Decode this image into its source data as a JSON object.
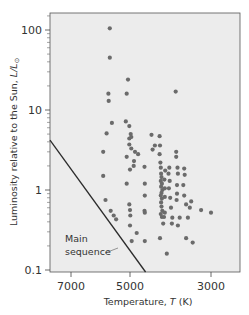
{
  "chart_data": {
    "type": "scatter",
    "title": "",
    "xlabel": "Temperature, T (K)",
    "ylabel": "Luminosity relative to the Sun, L/L⊙",
    "x_scale": "log",
    "x_reversed": true,
    "y_scale": "log",
    "xlim": [
      7800,
      2200
    ],
    "ylim": [
      0.1,
      160
    ],
    "x_ticks": [
      7000,
      5000,
      3000
    ],
    "x_tick_labels": [
      "7000",
      "5000",
      "3000"
    ],
    "y_ticks": [
      0.1,
      1,
      10,
      100
    ],
    "y_tick_labels": [
      "0.1",
      "1",
      "10",
      "100"
    ],
    "grid": false,
    "legend": null,
    "background": "#ececec",
    "point_color": "#6b6b6b",
    "line_color": "#2b2b2b",
    "annotations": [
      {
        "text_lines": [
          "Main",
          "sequence"
        ],
        "points_to": "main-sequence-line"
      }
    ],
    "lines": [
      {
        "name": "Main sequence",
        "points": [
          {
            "T": 7800,
            "L": 4.2
          },
          {
            "T": 4550,
            "L": 0.1
          }
        ]
      }
    ],
    "series": [
      {
        "name": "Stars",
        "points": [
          {
            "T": 5650,
            "L": 105
          },
          {
            "T": 5650,
            "L": 45
          },
          {
            "T": 5700,
            "L": 16
          },
          {
            "T": 5690,
            "L": 13
          },
          {
            "T": 5580,
            "L": 6.9
          },
          {
            "T": 5760,
            "L": 5.1
          },
          {
            "T": 5880,
            "L": 3.0
          },
          {
            "T": 5880,
            "L": 1.5
          },
          {
            "T": 5800,
            "L": 0.75
          },
          {
            "T": 5620,
            "L": 0.55
          },
          {
            "T": 5520,
            "L": 0.48
          },
          {
            "T": 5440,
            "L": 0.43
          },
          {
            "T": 5060,
            "L": 24
          },
          {
            "T": 5100,
            "L": 16
          },
          {
            "T": 5130,
            "L": 7.2
          },
          {
            "T": 5020,
            "L": 6.3
          },
          {
            "T": 4980,
            "L": 5.0
          },
          {
            "T": 5020,
            "L": 4.4
          },
          {
            "T": 4960,
            "L": 4.6
          },
          {
            "T": 5020,
            "L": 3.7
          },
          {
            "T": 4960,
            "L": 3.3
          },
          {
            "T": 4850,
            "L": 3.0
          },
          {
            "T": 4760,
            "L": 2.8
          },
          {
            "T": 5100,
            "L": 2.6
          },
          {
            "T": 4880,
            "L": 2.3
          },
          {
            "T": 4890,
            "L": 2.0
          },
          {
            "T": 5000,
            "L": 1.8
          },
          {
            "T": 5100,
            "L": 1.2
          },
          {
            "T": 5020,
            "L": 0.66
          },
          {
            "T": 5000,
            "L": 0.56
          },
          {
            "T": 4990,
            "L": 0.48
          },
          {
            "T": 5000,
            "L": 0.36
          },
          {
            "T": 4950,
            "L": 0.23
          },
          {
            "T": 4800,
            "L": 0.29
          },
          {
            "T": 4580,
            "L": 1.95
          },
          {
            "T": 4570,
            "L": 1.2
          },
          {
            "T": 4570,
            "L": 0.85
          },
          {
            "T": 4580,
            "L": 0.55
          },
          {
            "T": 4570,
            "L": 0.52
          },
          {
            "T": 4570,
            "L": 0.23
          },
          {
            "T": 4390,
            "L": 4.9
          },
          {
            "T": 4300,
            "L": 3.6
          },
          {
            "T": 4360,
            "L": 3.2
          },
          {
            "T": 4180,
            "L": 4.7
          },
          {
            "T": 4170,
            "L": 3.6
          },
          {
            "T": 4180,
            "L": 2.8
          },
          {
            "T": 4160,
            "L": 2.2
          },
          {
            "T": 4150,
            "L": 1.9
          },
          {
            "T": 4140,
            "L": 1.6
          },
          {
            "T": 4130,
            "L": 1.45
          },
          {
            "T": 4150,
            "L": 1.3
          },
          {
            "T": 4120,
            "L": 1.2
          },
          {
            "T": 4140,
            "L": 1.1
          },
          {
            "T": 4110,
            "L": 1.0
          },
          {
            "T": 4130,
            "L": 0.92
          },
          {
            "T": 4150,
            "L": 0.85
          },
          {
            "T": 4120,
            "L": 0.78
          },
          {
            "T": 4140,
            "L": 0.7
          },
          {
            "T": 4130,
            "L": 0.62
          },
          {
            "T": 4110,
            "L": 0.55
          },
          {
            "T": 4150,
            "L": 0.5
          },
          {
            "T": 4120,
            "L": 0.46
          },
          {
            "T": 4070,
            "L": 0.46
          },
          {
            "T": 4090,
            "L": 0.38
          },
          {
            "T": 4050,
            "L": 0.52
          },
          {
            "T": 4050,
            "L": 1.05
          },
          {
            "T": 4050,
            "L": 0.82
          },
          {
            "T": 4060,
            "L": 1.35
          },
          {
            "T": 4040,
            "L": 1.75
          },
          {
            "T": 4000,
            "L": 0.16
          },
          {
            "T": 4170,
            "L": 0.25
          },
          {
            "T": 3960,
            "L": 1.6
          },
          {
            "T": 3940,
            "L": 1.9
          },
          {
            "T": 3930,
            "L": 1.3
          },
          {
            "T": 3950,
            "L": 1.05
          },
          {
            "T": 3920,
            "L": 0.8
          },
          {
            "T": 3900,
            "L": 0.6
          },
          {
            "T": 3870,
            "L": 0.45
          },
          {
            "T": 3880,
            "L": 0.38
          },
          {
            "T": 3790,
            "L": 17
          },
          {
            "T": 3780,
            "L": 3.0
          },
          {
            "T": 3780,
            "L": 2.6
          },
          {
            "T": 3750,
            "L": 1.9
          },
          {
            "T": 3740,
            "L": 1.6
          },
          {
            "T": 3760,
            "L": 1.15
          },
          {
            "T": 3760,
            "L": 0.9
          },
          {
            "T": 3770,
            "L": 0.75
          },
          {
            "T": 3700,
            "L": 0.45
          },
          {
            "T": 3740,
            "L": 0.36
          },
          {
            "T": 3600,
            "L": 1.85
          },
          {
            "T": 3590,
            "L": 1.55
          },
          {
            "T": 3620,
            "L": 1.15
          },
          {
            "T": 3600,
            "L": 0.85
          },
          {
            "T": 3560,
            "L": 0.66
          },
          {
            "T": 3520,
            "L": 0.45
          },
          {
            "T": 3560,
            "L": 0.25
          },
          {
            "T": 3480,
            "L": 0.6
          },
          {
            "T": 3450,
            "L": 0.72
          },
          {
            "T": 3420,
            "L": 0.22
          },
          {
            "T": 3250,
            "L": 0.56
          },
          {
            "T": 3060,
            "L": 0.52
          }
        ]
      }
    ]
  },
  "axes": {
    "x_title": "Temperature, ",
    "x_title_var": "T",
    "x_title_unit": " (K)",
    "y_title": "Luminosity relative to the Sun, ",
    "y_title_var": "L/L",
    "y_title_sun": "⊙"
  },
  "annotation": {
    "line1": "Main",
    "line2": "sequence"
  }
}
